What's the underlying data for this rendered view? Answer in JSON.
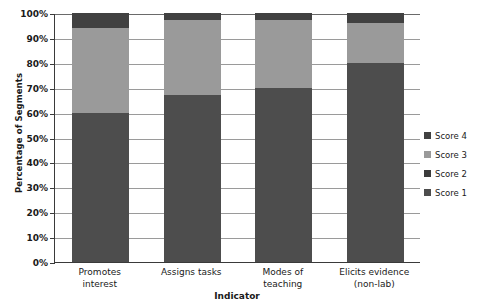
{
  "chart_data": {
    "type": "bar",
    "subtype": "100-percent-stacked-column",
    "title": "",
    "xlabel": "Indicator",
    "ylabel": "Percentage of Segments",
    "categories": [
      "Promotes interest",
      "Assigns tasks",
      "Modes of teaching",
      "Elicits evidence (non-lab)"
    ],
    "category_lines": [
      [
        "Promotes",
        "interest"
      ],
      [
        "Assigns tasks"
      ],
      [
        "Modes of",
        "teaching"
      ],
      [
        "Elicits evidence",
        "(non-lab)"
      ]
    ],
    "series": [
      {
        "name": "Score 1",
        "color": "#4d4d4d",
        "values": [
          60,
          67,
          70,
          80
        ]
      },
      {
        "name": "Score 2",
        "color": "#3c3c3c",
        "values": [
          0,
          0,
          0,
          0
        ]
      },
      {
        "name": "Score 3",
        "color": "#9a9a9a",
        "values": [
          34,
          30,
          27,
          16
        ]
      },
      {
        "name": "Score 4",
        "color": "#414141",
        "values": [
          6,
          3,
          3,
          4
        ]
      }
    ],
    "stack_order": [
      "Score 1",
      "Score 2",
      "Score 3",
      "Score 4"
    ],
    "ylim": [
      0,
      100
    ],
    "ytick_values": [
      0,
      10,
      20,
      30,
      40,
      50,
      60,
      70,
      80,
      90,
      100
    ],
    "ytick_labels": [
      "0%",
      "10%",
      "20%",
      "30%",
      "40%",
      "50%",
      "60%",
      "70%",
      "80%",
      "90%",
      "100%"
    ],
    "grid": true,
    "grid_axis": "y",
    "legend_position": "right",
    "legend_entries": [
      {
        "label": "Score 4",
        "color": "#414141"
      },
      {
        "label": "Score 3",
        "color": "#9a9a9a"
      },
      {
        "label": "Score 2",
        "color": "#3c3c3c"
      },
      {
        "label": "Score 1",
        "color": "#4d4d4d"
      }
    ],
    "colors": {
      "score1": "#4d4d4d",
      "score2": "#3c3c3c",
      "score3": "#9a9a9a",
      "score4": "#414141",
      "axis": "#3a3a3a",
      "gridline": "#9a9a9a",
      "background": "#ffffff",
      "text": "#1a1a1a"
    }
  }
}
